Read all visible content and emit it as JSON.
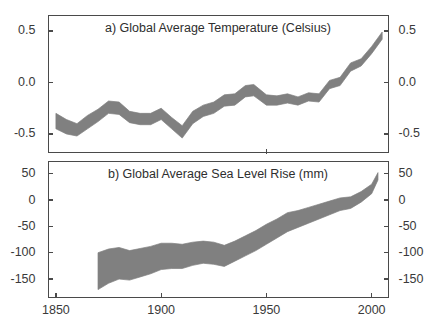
{
  "figure": {
    "background": "#ffffff",
    "band_color": "#808080",
    "axis_color": "#4a4a4a",
    "text_color": "#3a3a3a"
  },
  "chart_data": [
    {
      "type": "area",
      "panel_label": "a",
      "title": "a) Global Average Temperature (Celsius)",
      "xlabel": "",
      "ylabel": "Celsius",
      "xlim": [
        1846,
        2008
      ],
      "ylim": [
        -0.68,
        0.66
      ],
      "xticks": [
        1850,
        1900,
        1950,
        2000
      ],
      "xticklabels": [
        "1850",
        "1900",
        "1950",
        "2000"
      ],
      "yticks": [
        0.5,
        0.0,
        -0.5
      ],
      "yticklabels": [
        "0.5",
        "0.0",
        "-0.5"
      ],
      "grid": false,
      "legend": "none",
      "axis_ticks_both_sides": true,
      "series": [
        {
          "name": "Global average temperature anomaly (uncertainty band)",
          "x": [
            1850,
            1855,
            1860,
            1865,
            1870,
            1875,
            1880,
            1885,
            1890,
            1895,
            1900,
            1905,
            1910,
            1915,
            1920,
            1925,
            1930,
            1935,
            1940,
            1944,
            1950,
            1955,
            1960,
            1965,
            1970,
            1975,
            1980,
            1985,
            1990,
            1995,
            2000,
            2005
          ],
          "upper": [
            -0.3,
            -0.36,
            -0.4,
            -0.32,
            -0.26,
            -0.18,
            -0.19,
            -0.28,
            -0.3,
            -0.3,
            -0.25,
            -0.34,
            -0.42,
            -0.28,
            -0.22,
            -0.19,
            -0.12,
            -0.11,
            -0.03,
            -0.02,
            -0.12,
            -0.13,
            -0.11,
            -0.14,
            -0.1,
            -0.11,
            0.02,
            0.05,
            0.19,
            0.23,
            0.35,
            0.49
          ],
          "lower": [
            -0.45,
            -0.5,
            -0.52,
            -0.45,
            -0.38,
            -0.3,
            -0.31,
            -0.39,
            -0.41,
            -0.41,
            -0.36,
            -0.45,
            -0.54,
            -0.4,
            -0.33,
            -0.3,
            -0.23,
            -0.22,
            -0.14,
            -0.13,
            -0.22,
            -0.22,
            -0.2,
            -0.22,
            -0.18,
            -0.19,
            -0.06,
            -0.03,
            0.11,
            0.16,
            0.28,
            0.42
          ]
        }
      ]
    },
    {
      "type": "area",
      "panel_label": "b",
      "title": "b) Global Average Sea Level Rise (mm)",
      "xlabel": "",
      "ylabel": "mm",
      "xlim": [
        1846,
        2008
      ],
      "ylim": [
        -185,
        75
      ],
      "xticks": [
        1850,
        1900,
        1950,
        2000
      ],
      "xticklabels": [
        "1850",
        "1900",
        "1950",
        "2000"
      ],
      "yticks": [
        50,
        0,
        -50,
        -100,
        -150
      ],
      "yticklabels": [
        "50",
        "0",
        "-50",
        "-100",
        "-150"
      ],
      "grid": false,
      "legend": "none",
      "axis_ticks_both_sides": true,
      "series": [
        {
          "name": "Global average sea level rise (uncertainty band)",
          "x": [
            1870,
            1875,
            1880,
            1885,
            1890,
            1895,
            1900,
            1905,
            1910,
            1915,
            1920,
            1925,
            1930,
            1935,
            1940,
            1945,
            1950,
            1955,
            1960,
            1965,
            1970,
            1975,
            1980,
            1985,
            1990,
            1995,
            2000,
            2003
          ],
          "upper": [
            -100,
            -93,
            -90,
            -96,
            -92,
            -88,
            -82,
            -82,
            -84,
            -80,
            -78,
            -80,
            -86,
            -78,
            -68,
            -58,
            -46,
            -36,
            -24,
            -20,
            -14,
            -8,
            -2,
            4,
            6,
            16,
            30,
            52
          ],
          "lower": [
            -170,
            -158,
            -150,
            -152,
            -146,
            -140,
            -132,
            -130,
            -130,
            -124,
            -120,
            -122,
            -126,
            -116,
            -106,
            -96,
            -84,
            -72,
            -60,
            -52,
            -44,
            -36,
            -28,
            -20,
            -16,
            -4,
            12,
            38
          ]
        }
      ]
    }
  ],
  "panel_a": {
    "title": "a) Global Average Temperature (Celsius)",
    "y_labels_left": [
      "0.5",
      "0.0",
      "-0.5"
    ],
    "y_labels_right": [
      "0.5",
      "0.0",
      "-0.5"
    ]
  },
  "panel_b": {
    "title": "b) Global Average Sea Level Rise (mm)",
    "y_labels_left": [
      "50",
      "0",
      "-50",
      "-100",
      "-150"
    ],
    "y_labels_right": [
      "50",
      "0",
      "-50",
      "-100",
      "-150"
    ]
  },
  "x_axis": {
    "labels": [
      "1850",
      "1900",
      "1950",
      "2000"
    ]
  }
}
